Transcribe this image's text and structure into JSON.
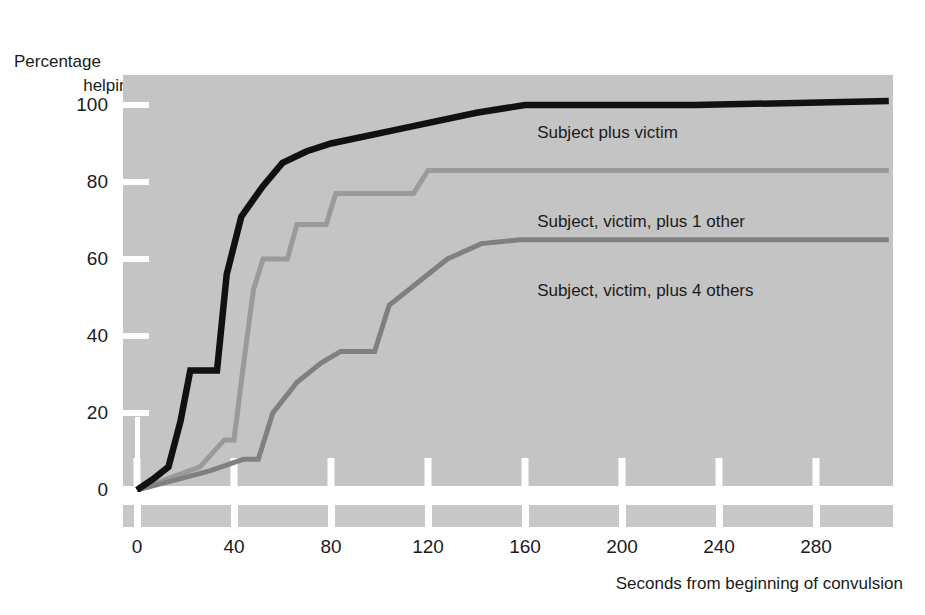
{
  "chart_data": {
    "type": "line",
    "title": "",
    "ylabel": "Percentage helping",
    "xlabel": "Seconds from beginning of convulsion",
    "xlim": [
      0,
      310
    ],
    "ylim": [
      0,
      108
    ],
    "grid": false,
    "legend_position": "inline-right",
    "xticks": [
      0,
      40,
      80,
      120,
      160,
      200,
      240,
      280
    ],
    "yticks": [
      0,
      20,
      40,
      60,
      80,
      100
    ],
    "yminor": [
      10
    ],
    "series": [
      {
        "name": "Subject plus victim",
        "color": "#111111",
        "label_x": 310,
        "label_y": 93,
        "points": [
          [
            0,
            0
          ],
          [
            7,
            3
          ],
          [
            13,
            6
          ],
          [
            18,
            18
          ],
          [
            22,
            31
          ],
          [
            33,
            31
          ],
          [
            37,
            56
          ],
          [
            43,
            71
          ],
          [
            52,
            79
          ],
          [
            60,
            85
          ],
          [
            70,
            88
          ],
          [
            80,
            90
          ],
          [
            110,
            94
          ],
          [
            140,
            98
          ],
          [
            160,
            100
          ],
          [
            230,
            100
          ],
          [
            310,
            101
          ]
        ]
      },
      {
        "name": "Subject, victim, plus 1 other",
        "color": "#9a9a9a",
        "label_x": 310,
        "label_y": 70,
        "points": [
          [
            0,
            0
          ],
          [
            26,
            6
          ],
          [
            36,
            13
          ],
          [
            40,
            13
          ],
          [
            44,
            33
          ],
          [
            48,
            52
          ],
          [
            52,
            60
          ],
          [
            62,
            60
          ],
          [
            66,
            69
          ],
          [
            78,
            69
          ],
          [
            82,
            77
          ],
          [
            114,
            77
          ],
          [
            120,
            83
          ],
          [
            160,
            83
          ],
          [
            230,
            83
          ],
          [
            310,
            83
          ]
        ]
      },
      {
        "name": "Subject, victim, plus 4 others",
        "color": "#808080",
        "label_x": 310,
        "label_y": 52,
        "points": [
          [
            0,
            0
          ],
          [
            30,
            5
          ],
          [
            44,
            8
          ],
          [
            50,
            8
          ],
          [
            56,
            20
          ],
          [
            66,
            28
          ],
          [
            76,
            33
          ],
          [
            84,
            36
          ],
          [
            98,
            36
          ],
          [
            104,
            48
          ],
          [
            118,
            55
          ],
          [
            128,
            60
          ],
          [
            142,
            64
          ],
          [
            158,
            65
          ],
          [
            230,
            65
          ],
          [
            310,
            65
          ]
        ]
      }
    ]
  },
  "axis": {
    "y_title_line1": "Percentage",
    "y_title_line2": "helping",
    "y_labels": [
      "100",
      "80",
      "60",
      "40",
      "20",
      "0"
    ],
    "x_labels": [
      "0",
      "40",
      "80",
      "120",
      "160",
      "200",
      "240",
      "280"
    ],
    "x_title": "Seconds from beginning of convulsion"
  },
  "annotations": {
    "series1_label": "Subject plus victim",
    "series2_label": "Subject, victim, plus 1 other",
    "series3_label": "Subject, victim, plus 4 others"
  },
  "colors": {
    "panel_bg": "#c4c4c4",
    "band_bg": "#c8c8c8",
    "series1": "#111111",
    "series2": "#9a9a9a",
    "series3": "#808080",
    "tick": "#ffffff",
    "text": "#1b1b1b"
  }
}
